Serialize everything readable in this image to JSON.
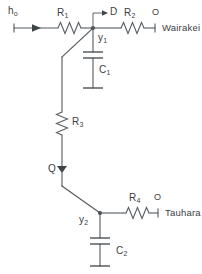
{
  "diagram": {
    "type": "electrical-circuit-schematic",
    "stroke_color": "#555a5e",
    "text_color": "#3b4043",
    "background": "#ffffff"
  },
  "labels": {
    "source": {
      "base": "h",
      "sub": "o"
    },
    "r1": {
      "base": "R",
      "sub": "1"
    },
    "r2": {
      "base": "R",
      "sub": "2"
    },
    "r3": {
      "base": "R",
      "sub": "3"
    },
    "r4": {
      "base": "R",
      "sub": "4"
    },
    "c1": {
      "base": "C",
      "sub": "1"
    },
    "c2": {
      "base": "C",
      "sub": "2"
    },
    "y1": {
      "base": "y",
      "sub": "1"
    },
    "y2": {
      "base": "y",
      "sub": "2"
    },
    "node_d": "D",
    "node_q": "Q",
    "port_o_top": "O",
    "port_o_bottom": "O",
    "terminal_wairakei": "Wairakei",
    "terminal_tauhara": "Tauhara"
  },
  "components": [
    {
      "id": "R1",
      "kind": "resistor",
      "orientation": "horizontal",
      "label": "R1"
    },
    {
      "id": "R2",
      "kind": "resistor",
      "orientation": "horizontal",
      "label": "R2"
    },
    {
      "id": "R3",
      "kind": "resistor",
      "orientation": "vertical",
      "label": "R3"
    },
    {
      "id": "R4",
      "kind": "resistor",
      "orientation": "horizontal",
      "label": "R4"
    },
    {
      "id": "C1",
      "kind": "capacitor",
      "orientation": "vertical",
      "label": "C1"
    },
    {
      "id": "C2",
      "kind": "capacitor",
      "orientation": "vertical",
      "label": "C2"
    },
    {
      "id": "ho",
      "kind": "flow-arrow-source",
      "orientation": "horizontal",
      "label": "ho"
    },
    {
      "id": "D",
      "kind": "flow-arrow-out",
      "orientation": "horizontal",
      "label": "D"
    },
    {
      "id": "Q",
      "kind": "flow-arrow-down",
      "orientation": "vertical",
      "label": "Q"
    }
  ],
  "nodes": [
    {
      "id": "node-y1",
      "label": "y1"
    },
    {
      "id": "node-y2",
      "label": "y2"
    }
  ]
}
